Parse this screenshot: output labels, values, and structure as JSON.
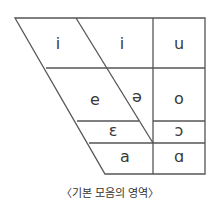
{
  "diagram": {
    "title": "기본 모음의 영역",
    "caption": "〈기본 모음의 영역〉",
    "colors": {
      "line": "#555555",
      "text": "#3a3a3a"
    },
    "cells": [
      {
        "id": "front-high",
        "label": "i",
        "x": 58,
        "y": 44
      },
      {
        "id": "central-high",
        "label": "i",
        "x": 122,
        "y": 44
      },
      {
        "id": "back-high",
        "label": "u",
        "x": 179,
        "y": 44
      },
      {
        "id": "front-mid",
        "label": "e",
        "x": 95,
        "y": 100
      },
      {
        "id": "central-mid",
        "label": "ə",
        "x": 137,
        "y": 97
      },
      {
        "id": "back-mid-high",
        "label": "o",
        "x": 179,
        "y": 99
      },
      {
        "id": "front-mid-low",
        "label": "ɛ",
        "x": 113,
        "y": 131
      },
      {
        "id": "back-mid-low",
        "label": "ɔ",
        "x": 179,
        "y": 131
      },
      {
        "id": "front-low",
        "label": "a",
        "x": 125,
        "y": 157
      },
      {
        "id": "back-low",
        "label": "ɑ",
        "x": 179,
        "y": 157
      }
    ]
  }
}
